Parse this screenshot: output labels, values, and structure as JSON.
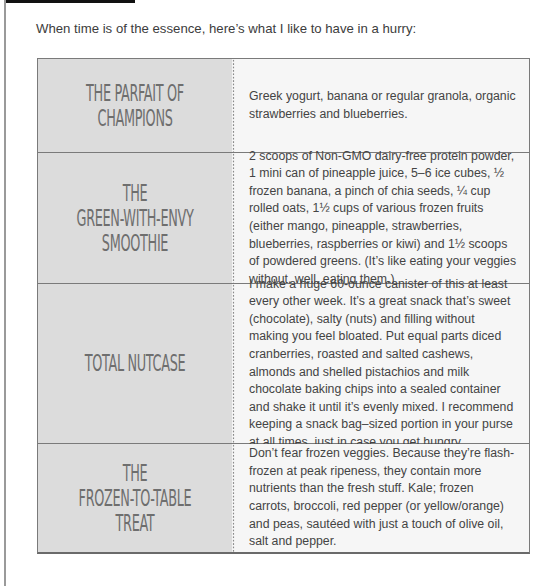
{
  "intro_text": "When time is of the essence, here’s  what I like to have in a hurry:",
  "colors": {
    "title_cell_bg": "#dcdcdc",
    "desc_cell_bg": "#f6f6f6",
    "title_text": "#6e6e6e",
    "border": "#7a7a7a",
    "top_bar": "#111111"
  },
  "rows": [
    {
      "title": "THE PARFAIT OF\nCHAMPIONS",
      "description": "Greek yogurt, banana or regular granola, organic strawberries and blueberries."
    },
    {
      "title": "THE\nGREEN-WITH-ENVY\nSMOOTHIE",
      "description": "2 scoops of Non-GMO dairy-free protein powder, 1 mini can of pineapple juice, 5–6 ice cubes, ½ frozen banana, a pinch of chia seeds, ¼ cup rolled oats, 1½ cups of various frozen fruits (either mango, pineapple, strawberries, blueberries, raspberries or kiwi) and 1½ scoops of powdered greens. (It’s like eating your veggies without, well, eating them.)"
    },
    {
      "title": "TOTAL NUTCASE",
      "description": "I make a huge 60-ounce canister of this at least every other week. It’s a great snack that’s sweet (chocolate), salty (nuts) and filling without making you feel bloated. Put equal parts diced cranberries, roasted and salted cashews, almonds and shelled pistachios and milk chocolate baking chips into a sealed container and shake it until it’s evenly mixed. I recommend keeping a snack bag–sized portion in your purse at all times, just in case you get hungry."
    },
    {
      "title": "THE\nFROZEN-TO-TABLE\nTREAT",
      "description": "Don’t fear frozen veggies. Because they’re flash-frozen at peak ripeness, they contain more nutrients than the fresh stuff. Kale; frozen carrots, broccoli, red pepper (or yellow/orange) and peas, sautéed with just a touch of olive oil, salt and pepper."
    }
  ]
}
